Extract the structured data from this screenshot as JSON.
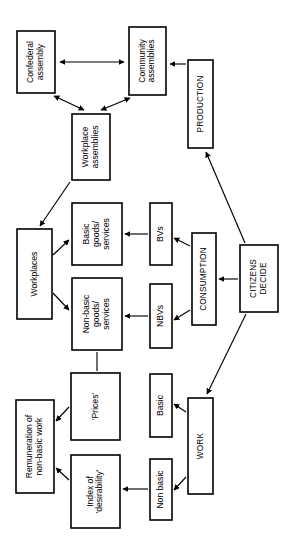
{
  "diagram": {
    "orientation": "rotated-90-ccw",
    "background_color": "#ffffff",
    "line_color": "#000000",
    "box_fill": "#ffffff",
    "nodes": [
      {
        "id": "confederal-assembly",
        "label": "Confederal\nassembly",
        "x": 17,
        "y": 31,
        "w": 38,
        "h": 62,
        "style": "mixed"
      },
      {
        "id": "community-assemblies",
        "label": "Community\nassemblies",
        "x": 129,
        "y": 27,
        "w": 37,
        "h": 68,
        "style": "mixed"
      },
      {
        "id": "workplace-assemblies",
        "label": "Workplace\nassemblies",
        "x": 72,
        "y": 114,
        "w": 38,
        "h": 66,
        "style": "mixed"
      },
      {
        "id": "production",
        "label": "PRODUCTION",
        "x": 188,
        "y": 60,
        "w": 25,
        "h": 88,
        "style": "caps"
      },
      {
        "id": "workplaces",
        "label": "Workplaces",
        "x": 17,
        "y": 229,
        "w": 35,
        "h": 90,
        "style": "mixed"
      },
      {
        "id": "basic-goods-services",
        "label": "Basic\ngoods/\nservices",
        "x": 72,
        "y": 203,
        "w": 50,
        "h": 62,
        "style": "mixed"
      },
      {
        "id": "non-basic-goods-services",
        "label": "Non-basic\ngoods/\nservices",
        "x": 72,
        "y": 278,
        "w": 50,
        "h": 72,
        "style": "mixed"
      },
      {
        "id": "bvs",
        "label": "BVs",
        "x": 150,
        "y": 203,
        "w": 22,
        "h": 62,
        "style": "mixed"
      },
      {
        "id": "nbvs",
        "label": "NBVs",
        "x": 150,
        "y": 284,
        "w": 22,
        "h": 64,
        "style": "mixed"
      },
      {
        "id": "consumption",
        "label": "CONSUMPTION",
        "x": 192,
        "y": 233,
        "w": 24,
        "h": 92,
        "style": "caps"
      },
      {
        "id": "citizens-decide",
        "label": "CITIZENS\nDECIDE",
        "x": 240,
        "y": 245,
        "w": 38,
        "h": 67,
        "style": "caps"
      },
      {
        "id": "remuneration",
        "label": "Remuneration of\nnon-basic work",
        "x": 16,
        "y": 400,
        "w": 38,
        "h": 93,
        "style": "mixed"
      },
      {
        "id": "prices",
        "label": "'Prices'",
        "x": 71,
        "y": 373,
        "w": 49,
        "h": 67,
        "style": "mixed"
      },
      {
        "id": "index-of-desirability",
        "label": "Index of\n'desirability'",
        "x": 71,
        "y": 455,
        "w": 49,
        "h": 73,
        "style": "mixed"
      },
      {
        "id": "basic",
        "label": "Basic",
        "x": 150,
        "y": 374,
        "w": 22,
        "h": 63,
        "style": "mixed"
      },
      {
        "id": "non-basic",
        "label": "Non basic",
        "x": 150,
        "y": 459,
        "w": 22,
        "h": 61,
        "style": "mixed"
      },
      {
        "id": "work",
        "label": "WORK",
        "x": 188,
        "y": 398,
        "w": 25,
        "h": 96,
        "style": "caps"
      }
    ],
    "edges": [
      {
        "id": "confederal-community",
        "from": "confederal-assembly",
        "to": "community-assemblies",
        "arrows": "both",
        "path": "M 60,62 L 124,62"
      },
      {
        "id": "workplace-confederal",
        "from": "workplace-assemblies",
        "to": "confederal-assembly",
        "arrows": "both",
        "path": "M 84,110 L 54,96"
      },
      {
        "id": "workplace-community",
        "from": "workplace-assemblies",
        "to": "community-assemblies",
        "arrows": "both",
        "path": "M 101,110 L 130,98"
      },
      {
        "id": "production-community",
        "from": "production",
        "to": "community-assemblies",
        "arrows": "end",
        "path": "M 186,64 L 170,64"
      },
      {
        "id": "citizens-production",
        "from": "citizens-decide",
        "to": "production",
        "arrows": "end",
        "path": "M 245,243 L 206,152"
      },
      {
        "id": "workplaceassm-workplaces",
        "from": "workplace-assemblies",
        "to": "workplaces",
        "arrows": "end",
        "path": "M 70,182 L 40,226"
      },
      {
        "id": "workplaces-basic",
        "from": "workplaces",
        "to": "basic-goods-services",
        "arrows": "end",
        "path": "M 53,255 L 69,240"
      },
      {
        "id": "workplaces-nonbasic",
        "from": "workplaces",
        "to": "non-basic-goods-services",
        "arrows": "end",
        "path": "M 53,293 L 69,310"
      },
      {
        "id": "bvs-basic",
        "from": "bvs",
        "to": "basic-goods-services",
        "arrows": "end",
        "path": "M 148,234 L 125,234"
      },
      {
        "id": "nbvs-nonbasic",
        "from": "nbvs",
        "to": "non-basic-goods-services",
        "arrows": "end",
        "path": "M 148,316 L 125,316"
      },
      {
        "id": "consumption-bvs",
        "from": "consumption",
        "to": "bvs",
        "arrows": "end",
        "path": "M 190,246 L 174,238"
      },
      {
        "id": "consumption-nbvs",
        "from": "consumption",
        "to": "nbvs",
        "arrows": "end",
        "path": "M 190,310 L 174,320"
      },
      {
        "id": "citizens-consumption",
        "from": "citizens-decide",
        "to": "consumption",
        "arrows": "end",
        "path": "M 238,279 L 219,279"
      },
      {
        "id": "nonbasic-prices",
        "from": "non-basic-goods-services",
        "to": "prices",
        "arrows": "none",
        "path": "M 97,352 L 97,371"
      },
      {
        "id": "prices-remuneration",
        "from": "prices",
        "to": "remuneration",
        "arrows": "end",
        "path": "M 69,407 L 56,421"
      },
      {
        "id": "index-remuneration",
        "from": "index-of-desirability",
        "to": "remuneration",
        "arrows": "end",
        "path": "M 69,480 L 56,468"
      },
      {
        "id": "nonbasic-index",
        "from": "non-basic",
        "to": "index-of-desirability",
        "arrows": "end",
        "path": "M 148,489 L 123,489"
      },
      {
        "id": "work-basic",
        "from": "work",
        "to": "basic",
        "arrows": "end",
        "path": "M 186,412 L 174,404"
      },
      {
        "id": "work-nonbasic",
        "from": "work",
        "to": "non-basic",
        "arrows": "end",
        "path": "M 186,477 L 174,490"
      },
      {
        "id": "citizens-work",
        "from": "citizens-decide",
        "to": "work",
        "arrows": "end",
        "path": "M 246,314 L 207,394"
      }
    ]
  }
}
